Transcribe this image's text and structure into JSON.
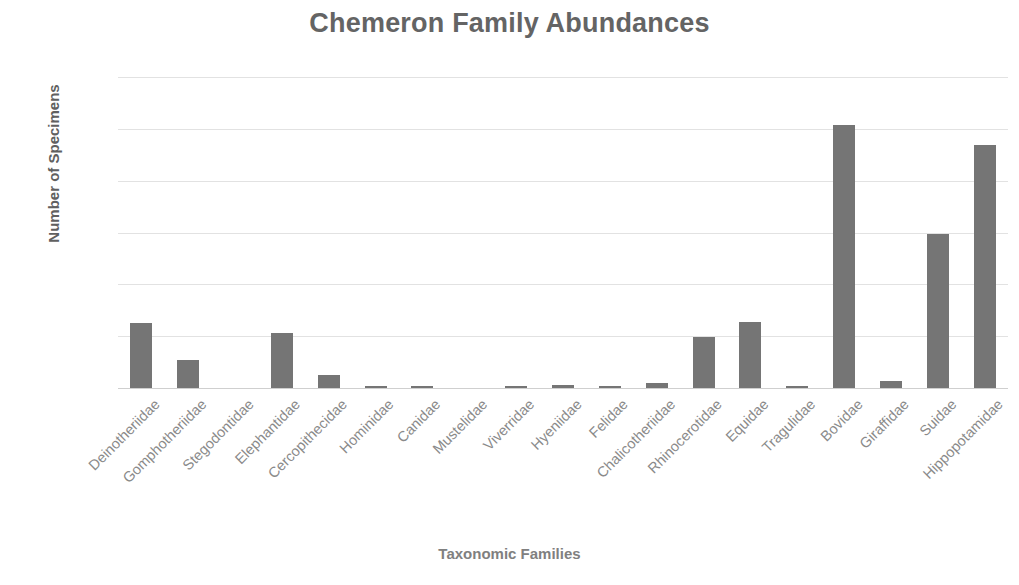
{
  "chart_data": {
    "type": "bar",
    "title": "Chemeron Family Abundances",
    "xlabel": "Taxonomic Families",
    "ylabel": "Number of Specimens",
    "ylim": [
      0,
      600
    ],
    "ytick_labels": [
      "600",
      "500",
      "400",
      "300",
      "200",
      "100",
      "0"
    ],
    "ytick_values": [
      600,
      500,
      400,
      300,
      200,
      100,
      0
    ],
    "grid": "horizontal",
    "legend": "none",
    "bar_color": "#757575",
    "categories": [
      "Deinotheriidae",
      "Gomphotheriidae",
      "Stegodontidae",
      "Elephantidae",
      "Cercopithecidae",
      "Hominidae",
      "Canidae",
      "Mustelidae",
      "Viverridae",
      "Hyeniidae",
      "Felidae",
      "Chalicotheriidae",
      "Rhinocerotidae",
      "Equidae",
      "Tragulidae",
      "Bovidae",
      "Giraffidae",
      "Suidae",
      "Hippopotamidae"
    ],
    "values": [
      125,
      55,
      0,
      107,
      25,
      4,
      2,
      0,
      2,
      5,
      4,
      9,
      99,
      127,
      3,
      508,
      14,
      297,
      468
    ]
  }
}
